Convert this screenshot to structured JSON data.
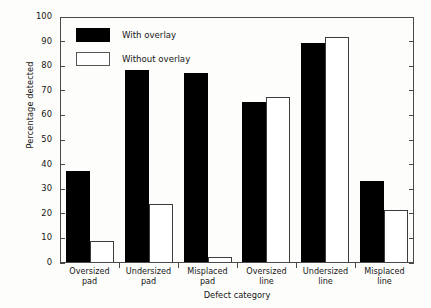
{
  "chart_data": {
    "type": "bar",
    "title": "",
    "xlabel": "Defect category",
    "ylabel": "Percentage detected",
    "ylim": [
      0,
      100
    ],
    "yticks": [
      0,
      10,
      20,
      30,
      40,
      50,
      60,
      70,
      80,
      90,
      100
    ],
    "ytick_labels": [
      "0",
      "10",
      "20",
      "30",
      "40",
      "50",
      "60",
      "70",
      "80",
      "90",
      "100"
    ],
    "grid": false,
    "legend_position": "upper-left-inside",
    "categories": [
      "Oversized pad",
      "Undersized pad",
      "Misplaced pad",
      "Oversized line",
      "Undersized line",
      "Misplaced line"
    ],
    "category_lines": [
      [
        "Oversized",
        "pad"
      ],
      [
        "Undersized",
        "pad"
      ],
      [
        "Misplaced",
        "pad"
      ],
      [
        "Oversized",
        "line"
      ],
      [
        "Undersized",
        "line"
      ],
      [
        "Misplaced",
        "line"
      ]
    ],
    "series": [
      {
        "name": "With overlay",
        "color": "#000000",
        "values": [
          37,
          78,
          77,
          65,
          89,
          33
        ]
      },
      {
        "name": "Without overlay",
        "color": "#ffffff",
        "values": [
          8.5,
          23.5,
          2,
          67,
          91.5,
          21
        ]
      }
    ]
  }
}
